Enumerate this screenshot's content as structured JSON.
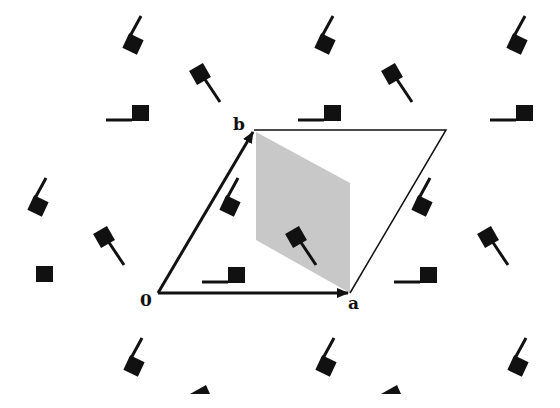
{
  "diagram": {
    "type": "2D crystal lattice with unit cell",
    "labels": {
      "origin": "0",
      "vector_a": "a",
      "vector_b": "b"
    },
    "colors": {
      "background": "#ffffff",
      "motif": "#111111",
      "cell_outline": "#111111",
      "shaded_region": "#c8c8c8"
    },
    "lattice": {
      "origin_px": [
        158,
        293
      ],
      "a_px": [
        192,
        0
      ],
      "b_px": [
        96,
        -163
      ]
    },
    "unit_cell_corners": [
      "0",
      "a",
      "a+b",
      "b"
    ],
    "shaded_cell": "Wigner-Seitz-like parallelogram between b and a",
    "motif_types": [
      "flag-left-tail",
      "flag-down-tail",
      "flag-up-tail"
    ]
  }
}
